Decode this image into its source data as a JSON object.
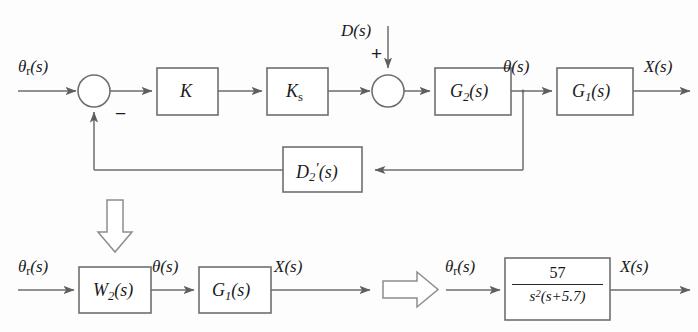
{
  "figure": {
    "type": "control-system-block-diagram",
    "background_color": "#fdfdfd",
    "line_color": "#6d6d70",
    "text_color": "#1a1a1a"
  },
  "top_row": {
    "input_signal": {
      "base": "θ",
      "sub": "r",
      "arg": "(s)"
    },
    "summing_junction_1": {
      "name": "sum-1",
      "negative_sign": "−"
    },
    "block_gain_k": {
      "label": "K"
    },
    "block_gain_ks": {
      "base": "K",
      "sub": "s"
    },
    "disturbance_signal": {
      "label": "D(s)",
      "sign": "+"
    },
    "summing_junction_2": {
      "name": "sum-2"
    },
    "block_g2": {
      "base": "G",
      "sub": "2",
      "arg": "(s)"
    },
    "theta_node": {
      "base": "θ",
      "arg": "(s)"
    },
    "block_g1": {
      "base": "G",
      "sub": "1",
      "arg": "(s)"
    },
    "output_signal": {
      "label": "X(s)"
    }
  },
  "feedback_row": {
    "block_d2_prime": {
      "base": "D",
      "sub": "2",
      "prime": "′",
      "arg": "(s)"
    }
  },
  "bottom_row": {
    "input_signal": {
      "base": "θ",
      "sub": "r",
      "arg": "(s)"
    },
    "block_w2": {
      "base": "W",
      "sub": "2",
      "arg": "(s)"
    },
    "theta_signal": {
      "base": "θ",
      "arg": "(s)"
    },
    "block_g1": {
      "base": "G",
      "sub": "1",
      "arg": "(s)"
    },
    "output_signal": {
      "label": "X(s)"
    }
  },
  "reduced_row": {
    "input_signal": {
      "base": "θ",
      "sub": "r",
      "arg": "(s)"
    },
    "transfer_function": {
      "numerator": "57",
      "denominator_base": "s",
      "denominator_exp": "2",
      "denominator_tail": "(s+5.7)",
      "full": "57 / (s^2(s+5.7))"
    },
    "output_signal": {
      "label": "X(s)"
    }
  },
  "annotations": {
    "down_arrow": "implies-down-arrow",
    "right_arrow": "implies-right-arrow"
  }
}
